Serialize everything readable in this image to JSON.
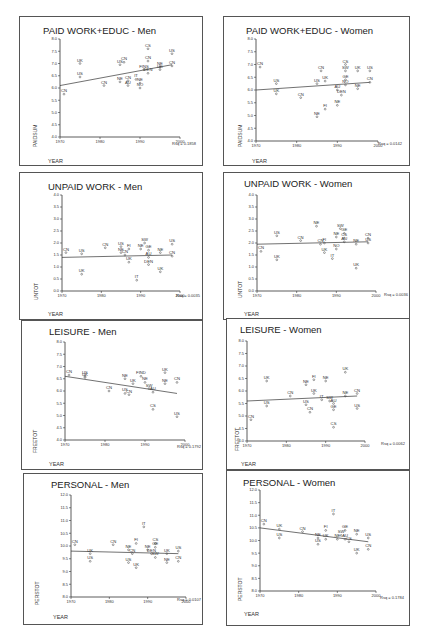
{
  "chart_data": [
    {
      "id": "paid-men",
      "type": "scatter",
      "title": "PAID WORK+EDUC - Men",
      "xlabel": "YEAR",
      "ylabel": "PAIDSUM",
      "xlim": [
        1970,
        2000
      ],
      "ylim": [
        4.0,
        8.0
      ],
      "xticks": [
        1970,
        1980,
        1990,
        2000
      ],
      "yticks": [
        4.0,
        4.5,
        5.0,
        5.5,
        6.0,
        6.5,
        7.0,
        7.5,
        8.0
      ],
      "r_squared_label": "Rsq = 0.1858",
      "fit_line": {
        "x": [
          1970,
          1998
        ],
        "y": [
          6.1,
          6.95
        ]
      },
      "points": [
        {
          "label": "CN",
          "x": 1971,
          "y": 5.75
        },
        {
          "label": "UK",
          "x": 1975,
          "y": 7.0
        },
        {
          "label": "US",
          "x": 1975,
          "y": 6.45
        },
        {
          "label": "CN",
          "x": 1981,
          "y": 6.1
        },
        {
          "label": "US",
          "x": 1985,
          "y": 6.95
        },
        {
          "label": "CN",
          "x": 1986,
          "y": 7.05
        },
        {
          "label": "NE",
          "x": 1985,
          "y": 6.25
        },
        {
          "label": "CN",
          "x": 1987,
          "y": 6.3
        },
        {
          "label": "AU",
          "x": 1987,
          "y": 6.1
        },
        {
          "label": "IT",
          "x": 1989,
          "y": 6.35
        },
        {
          "label": "NE",
          "x": 1990,
          "y": 6.2
        },
        {
          "label": "NO",
          "x": 1990,
          "y": 6.0
        },
        {
          "label": "CS",
          "x": 1992,
          "y": 7.6
        },
        {
          "label": "CN",
          "x": 1992,
          "y": 7.1
        },
        {
          "label": "FINS",
          "x": 1991,
          "y": 6.75
        },
        {
          "label": "DEN",
          "x": 1992,
          "y": 6.6
        },
        {
          "label": "NE",
          "x": 1995,
          "y": 6.85
        },
        {
          "label": "UK",
          "x": 1995,
          "y": 6.75
        },
        {
          "label": "US",
          "x": 1998,
          "y": 7.4
        },
        {
          "label": "CN",
          "x": 1998,
          "y": 6.9
        }
      ]
    },
    {
      "id": "paid-women",
      "type": "scatter",
      "title": "PAID WORK+EDUC - Women",
      "xlabel": "YEAR",
      "ylabel": "PAIDSUM",
      "xlim": [
        1970,
        2000
      ],
      "ylim": [
        4.0,
        8.0
      ],
      "xticks": [
        1970,
        1980,
        1990,
        2000
      ],
      "yticks": [
        4.0,
        4.5,
        5.0,
        5.5,
        6.0,
        6.5,
        7.0,
        7.5,
        8.0
      ],
      "r_squared_label": "Rsq = 0.0142",
      "fit_line": {
        "x": [
          1970,
          1998
        ],
        "y": [
          6.0,
          6.3
        ]
      },
      "points": [
        {
          "label": "CN",
          "x": 1971,
          "y": 6.9
        },
        {
          "label": "US",
          "x": 1975,
          "y": 6.25
        },
        {
          "label": "UK",
          "x": 1975,
          "y": 5.85
        },
        {
          "label": "CN",
          "x": 1981,
          "y": 5.7
        },
        {
          "label": "NE",
          "x": 1985,
          "y": 4.95
        },
        {
          "label": "US",
          "x": 1985,
          "y": 6.25
        },
        {
          "label": "CN",
          "x": 1986,
          "y": 6.75
        },
        {
          "label": "UK",
          "x": 1987,
          "y": 6.35
        },
        {
          "label": "FI",
          "x": 1987,
          "y": 5.25
        },
        {
          "label": "NE",
          "x": 1990,
          "y": 5.4
        },
        {
          "label": "AU",
          "x": 1990,
          "y": 6.0
        },
        {
          "label": "DEN",
          "x": 1991,
          "y": 5.8
        },
        {
          "label": "CS",
          "x": 1992,
          "y": 7.0
        },
        {
          "label": "SW",
          "x": 1992,
          "y": 6.75
        },
        {
          "label": "GE",
          "x": 1992,
          "y": 6.4
        },
        {
          "label": "NO",
          "x": 1992,
          "y": 6.2
        },
        {
          "label": "UK",
          "x": 1995,
          "y": 6.75
        },
        {
          "label": "NE",
          "x": 1995,
          "y": 6.05
        },
        {
          "label": "US",
          "x": 1998,
          "y": 6.75
        },
        {
          "label": "CN",
          "x": 1998,
          "y": 6.3
        }
      ]
    },
    {
      "id": "unpaid-men",
      "type": "scatter",
      "title": "UNPAID WORK - Men",
      "xlabel": "YEAR",
      "ylabel": "UNTOT",
      "xlim": [
        1970,
        2000
      ],
      "ylim": [
        0.0,
        4.0
      ],
      "xticks": [
        1970,
        1980,
        1990,
        2000
      ],
      "yticks": [
        0.0,
        0.5,
        1.0,
        1.5,
        2.0,
        2.5,
        3.0,
        3.5,
        4.0
      ],
      "r_squared_label": "Rsq = 0.0035",
      "fit_line": {
        "x": [
          1970,
          1998
        ],
        "y": [
          1.4,
          1.5
        ]
      },
      "points": [
        {
          "label": "CN",
          "x": 1971,
          "y": 1.6
        },
        {
          "label": "US",
          "x": 1975,
          "y": 1.55
        },
        {
          "label": "UK",
          "x": 1975,
          "y": 0.7
        },
        {
          "label": "CN",
          "x": 1981,
          "y": 1.8
        },
        {
          "label": "US",
          "x": 1985,
          "y": 1.85
        },
        {
          "label": "NE",
          "x": 1985,
          "y": 1.6
        },
        {
          "label": "CN",
          "x": 1986,
          "y": 1.5
        },
        {
          "label": "FI",
          "x": 1987,
          "y": 1.75
        },
        {
          "label": "UK",
          "x": 1987,
          "y": 1.2
        },
        {
          "label": "IT",
          "x": 1989,
          "y": 0.45
        },
        {
          "label": "SW",
          "x": 1991,
          "y": 2.0
        },
        {
          "label": "NE",
          "x": 1990,
          "y": 1.75
        },
        {
          "label": "GE",
          "x": 1992,
          "y": 1.7
        },
        {
          "label": "AU",
          "x": 1992,
          "y": 1.4
        },
        {
          "label": "DEN",
          "x": 1992,
          "y": 1.1
        },
        {
          "label": "NE",
          "x": 1995,
          "y": 1.6
        },
        {
          "label": "UK",
          "x": 1995,
          "y": 0.8
        },
        {
          "label": "US",
          "x": 1998,
          "y": 1.95
        },
        {
          "label": "CN",
          "x": 1998,
          "y": 1.45
        }
      ]
    },
    {
      "id": "unpaid-women",
      "type": "scatter",
      "title": "UNPAID WORK - Women",
      "xlabel": "YEAR",
      "ylabel": "UNTOT",
      "xlim": [
        1970,
        2000
      ],
      "ylim": [
        0.0,
        4.0
      ],
      "xticks": [
        1970,
        1980,
        1990,
        2000
      ],
      "yticks": [
        0.0,
        0.5,
        1.0,
        1.5,
        2.0,
        2.5,
        3.0,
        3.5,
        4.0
      ],
      "r_squared_label": "Rsq = 0.0036",
      "fit_line": {
        "x": [
          1970,
          1998
        ],
        "y": [
          1.95,
          2.05
        ]
      },
      "points": [
        {
          "label": "CN",
          "x": 1971,
          "y": 1.65
        },
        {
          "label": "US",
          "x": 1975,
          "y": 2.3
        },
        {
          "label": "UK",
          "x": 1975,
          "y": 1.3
        },
        {
          "label": "CN",
          "x": 1981,
          "y": 2.1
        },
        {
          "label": "NE",
          "x": 1985,
          "y": 2.7
        },
        {
          "label": "CN",
          "x": 1986,
          "y": 1.95
        },
        {
          "label": "FI",
          "x": 1987,
          "y": 2.0
        },
        {
          "label": "UK",
          "x": 1987,
          "y": 1.6
        },
        {
          "label": "IT",
          "x": 1989,
          "y": 1.35
        },
        {
          "label": "NO",
          "x": 1990,
          "y": 1.75
        },
        {
          "label": "NE",
          "x": 1990,
          "y": 2.25
        },
        {
          "label": "SW",
          "x": 1991,
          "y": 2.6
        },
        {
          "label": "GE",
          "x": 1992,
          "y": 2.4
        },
        {
          "label": "CS",
          "x": 1992,
          "y": 2.2
        },
        {
          "label": "AU",
          "x": 1992,
          "y": 2.05
        },
        {
          "label": "NE",
          "x": 1995,
          "y": 1.95
        },
        {
          "label": "UK",
          "x": 1995,
          "y": 0.95
        },
        {
          "label": "CN",
          "x": 1998,
          "y": 2.2
        },
        {
          "label": "US",
          "x": 1998,
          "y": 2.0
        }
      ]
    },
    {
      "id": "leisure-men",
      "type": "scatter",
      "title": "LEISURE - Men",
      "xlabel": "YEAR",
      "ylabel": "FREETOT",
      "xlim": [
        1970,
        2000
      ],
      "ylim": [
        4.0,
        8.0
      ],
      "xticks": [
        1970,
        1980,
        1990,
        2000
      ],
      "yticks": [
        4.0,
        4.5,
        5.0,
        5.5,
        6.0,
        6.5,
        7.0,
        7.5,
        8.0
      ],
      "r_squared_label": "Rsq = 0.1792",
      "fit_line": {
        "x": [
          1970,
          1998
        ],
        "y": [
          6.6,
          5.9
        ]
      },
      "points": [
        {
          "label": "CN",
          "x": 1971,
          "y": 6.65
        },
        {
          "label": "US",
          "x": 1975,
          "y": 6.6
        },
        {
          "label": "UK",
          "x": 1975,
          "y": 6.55
        },
        {
          "label": "CN",
          "x": 1981,
          "y": 6.0
        },
        {
          "label": "NE",
          "x": 1985,
          "y": 6.5
        },
        {
          "label": "US",
          "x": 1985,
          "y": 5.9
        },
        {
          "label": "CN",
          "x": 1986,
          "y": 5.85
        },
        {
          "label": "UK",
          "x": 1987,
          "y": 6.3
        },
        {
          "label": "FIND",
          "x": 1989,
          "y": 6.6
        },
        {
          "label": "NE",
          "x": 1990,
          "y": 6.35
        },
        {
          "label": "SW",
          "x": 1991,
          "y": 6.1
        },
        {
          "label": "AU",
          "x": 1992,
          "y": 5.95
        },
        {
          "label": "CS",
          "x": 1992,
          "y": 5.25
        },
        {
          "label": "UK",
          "x": 1995,
          "y": 6.75
        },
        {
          "label": "NE",
          "x": 1995,
          "y": 6.3
        },
        {
          "label": "CN",
          "x": 1998,
          "y": 6.35
        },
        {
          "label": "US",
          "x": 1998,
          "y": 4.95
        }
      ]
    },
    {
      "id": "leisure-women",
      "type": "scatter",
      "title": "LEISURE - Women",
      "xlabel": "YEAR",
      "ylabel": "FREETOT",
      "xlim": [
        1970,
        2000
      ],
      "ylim": [
        4.0,
        8.0
      ],
      "xticks": [
        1970,
        1980,
        1990,
        2000
      ],
      "yticks": [
        4.0,
        4.5,
        5.0,
        5.5,
        6.0,
        6.5,
        7.0,
        7.5,
        8.0
      ],
      "r_squared_label": "Rsq = 0.0062",
      "fit_line": {
        "x": [
          1970,
          1998
        ],
        "y": [
          5.6,
          5.8
        ]
      },
      "points": [
        {
          "label": "CN",
          "x": 1971,
          "y": 4.85
        },
        {
          "label": "UK",
          "x": 1975,
          "y": 6.4
        },
        {
          "label": "US",
          "x": 1975,
          "y": 5.4
        },
        {
          "label": "CN",
          "x": 1981,
          "y": 5.8
        },
        {
          "label": "NE",
          "x": 1985,
          "y": 6.25
        },
        {
          "label": "US",
          "x": 1985,
          "y": 5.45
        },
        {
          "label": "CN",
          "x": 1986,
          "y": 5.15
        },
        {
          "label": "FI",
          "x": 1987,
          "y": 6.45
        },
        {
          "label": "UK",
          "x": 1987,
          "y": 5.9
        },
        {
          "label": "IT",
          "x": 1989,
          "y": 5.65
        },
        {
          "label": "NE",
          "x": 1990,
          "y": 6.4
        },
        {
          "label": "SW",
          "x": 1991,
          "y": 5.6
        },
        {
          "label": "AU",
          "x": 1992,
          "y": 5.5
        },
        {
          "label": "GE",
          "x": 1992,
          "y": 5.25
        },
        {
          "label": "CS",
          "x": 1992,
          "y": 4.55
        },
        {
          "label": "UK",
          "x": 1995,
          "y": 6.75
        },
        {
          "label": "NE",
          "x": 1995,
          "y": 5.8
        },
        {
          "label": "CN",
          "x": 1998,
          "y": 5.9
        },
        {
          "label": "US",
          "x": 1998,
          "y": 5.3
        }
      ]
    },
    {
      "id": "personal-men",
      "type": "scatter",
      "title": "PERSONAL - Men",
      "xlabel": "YEAR",
      "ylabel": "PERSTOT",
      "xlim": [
        1970,
        2000
      ],
      "ylim": [
        8.0,
        12.0
      ],
      "xticks": [
        1970,
        1980,
        1990,
        2000
      ],
      "yticks": [
        8.0,
        8.5,
        9.0,
        9.5,
        10.0,
        10.5,
        11.0,
        11.5,
        12.0
      ],
      "r_squared_label": "Rsq = 0.0107",
      "fit_line": {
        "x": [
          1970,
          1998
        ],
        "y": [
          9.8,
          9.7
        ]
      },
      "points": [
        {
          "label": "CN",
          "x": 1971,
          "y": 10.05
        },
        {
          "label": "UK",
          "x": 1975,
          "y": 9.7
        },
        {
          "label": "US",
          "x": 1975,
          "y": 9.4
        },
        {
          "label": "CN",
          "x": 1981,
          "y": 10.05
        },
        {
          "label": "NE",
          "x": 1985,
          "y": 9.85
        },
        {
          "label": "US",
          "x": 1985,
          "y": 9.35
        },
        {
          "label": "CN",
          "x": 1986,
          "y": 9.7
        },
        {
          "label": "FI",
          "x": 1987,
          "y": 10.1
        },
        {
          "label": "UK",
          "x": 1987,
          "y": 9.15
        },
        {
          "label": "IT",
          "x": 1989,
          "y": 10.75
        },
        {
          "label": "NE",
          "x": 1990,
          "y": 9.85
        },
        {
          "label": "DEN",
          "x": 1991,
          "y": 9.7
        },
        {
          "label": "CS",
          "x": 1992,
          "y": 10.1
        },
        {
          "label": "GE",
          "x": 1992,
          "y": 9.95
        },
        {
          "label": "SW",
          "x": 1992,
          "y": 9.55
        },
        {
          "label": "UK",
          "x": 1995,
          "y": 9.7
        },
        {
          "label": "NE",
          "x": 1995,
          "y": 9.35
        },
        {
          "label": "US",
          "x": 1998,
          "y": 9.8
        },
        {
          "label": "CN",
          "x": 1998,
          "y": 9.4
        }
      ]
    },
    {
      "id": "personal-women",
      "type": "scatter",
      "title": "PERSONAL - Women",
      "xlabel": "YEAR",
      "ylabel": "PERSTOT",
      "xlim": [
        1970,
        2000
      ],
      "ylim": [
        8.0,
        12.0
      ],
      "xticks": [
        1970,
        1980,
        1990,
        2000
      ],
      "yticks": [
        8.0,
        8.5,
        9.0,
        9.5,
        10.0,
        10.5,
        11.0,
        11.5,
        12.0
      ],
      "r_squared_label": "Rsq = 0.1784",
      "fit_line": {
        "x": [
          1970,
          1998
        ],
        "y": [
          10.5,
          9.95
        ]
      },
      "points": [
        {
          "label": "CN",
          "x": 1971,
          "y": 10.65
        },
        {
          "label": "UK",
          "x": 1975,
          "y": 10.45
        },
        {
          "label": "US",
          "x": 1975,
          "y": 10.1
        },
        {
          "label": "CN",
          "x": 1981,
          "y": 10.35
        },
        {
          "label": "NE",
          "x": 1985,
          "y": 10.1
        },
        {
          "label": "US",
          "x": 1985,
          "y": 9.85
        },
        {
          "label": "UK",
          "x": 1987,
          "y": 10.05
        },
        {
          "label": "FI",
          "x": 1987,
          "y": 10.4
        },
        {
          "label": "IT",
          "x": 1989,
          "y": 11.05
        },
        {
          "label": "NE",
          "x": 1990,
          "y": 10.05
        },
        {
          "label": "SW",
          "x": 1991,
          "y": 10.2
        },
        {
          "label": "GE",
          "x": 1992,
          "y": 10.4
        },
        {
          "label": "AU",
          "x": 1992,
          "y": 10.05
        },
        {
          "label": "CS",
          "x": 1993,
          "y": 9.95
        },
        {
          "label": "NE",
          "x": 1995,
          "y": 10.25
        },
        {
          "label": "UK",
          "x": 1995,
          "y": 9.5
        },
        {
          "label": "US",
          "x": 1998,
          "y": 10.1
        },
        {
          "label": "CN",
          "x": 1998,
          "y": 9.65
        }
      ]
    }
  ],
  "panels": [
    {
      "title": "PAID WORK+EDUC - Men",
      "rsq": "Rsq = 0.1858",
      "xlabel": "YEAR",
      "ylabel": "PAIDSUM"
    },
    {
      "title": "PAID WORK+EDUC - Women",
      "rsq": "Rsq = 0.0142",
      "xlabel": "YEAR",
      "ylabel": "PAIDSUM"
    },
    {
      "title": "UNPAID WORK - Men",
      "rsq": "Rsq = 0.0035",
      "xlabel": "YEAR",
      "ylabel": "UNTOT"
    },
    {
      "title": "UNPAID WORK - Women",
      "rsq": "Rsq = 0.0036",
      "xlabel": "YEAR",
      "ylabel": "UNTOT"
    },
    {
      "title": "LEISURE - Men",
      "rsq": "Rsq = 0.1792",
      "xlabel": "YEAR",
      "ylabel": "FREETOT"
    },
    {
      "title": "LEISURE - Women",
      "rsq": "Rsq = 0.0062",
      "xlabel": "YEAR",
      "ylabel": "FREETOT"
    },
    {
      "title": "PERSONAL - Men",
      "rsq": "Rsq = 0.0107",
      "xlabel": "YEAR",
      "ylabel": "PERSTOT"
    },
    {
      "title": "PERSONAL - Women",
      "rsq": "Rsq = 0.1784",
      "xlabel": "YEAR",
      "ylabel": "PERSTOT"
    }
  ]
}
